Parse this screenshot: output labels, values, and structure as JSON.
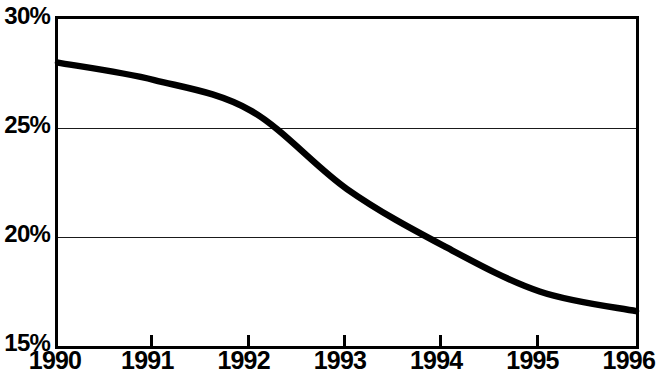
{
  "chart_data": {
    "type": "line",
    "title": "",
    "subtitle": "",
    "xlabel": "",
    "ylabel": "",
    "x": [
      1990,
      1991,
      1992,
      1993,
      1994,
      1995,
      1996
    ],
    "categories": [
      "1990",
      "1991",
      "1992",
      "1993",
      "1994",
      "1995",
      "1996"
    ],
    "values": [
      28.0,
      27.2,
      25.8,
      22.2,
      19.6,
      17.5,
      16.6
    ],
    "series": [
      {
        "name": "",
        "values": [
          28.0,
          27.2,
          25.8,
          22.2,
          19.6,
          17.5,
          16.6
        ]
      }
    ],
    "ylim": [
      15,
      30
    ],
    "xlim": [
      1990,
      1996
    ],
    "y_ticks": [
      15,
      20,
      25,
      30
    ],
    "y_tick_labels": [
      "15%",
      "20%",
      "25%",
      "30%"
    ],
    "x_ticks": [
      1990,
      1991,
      1992,
      1993,
      1994,
      1995,
      1996
    ],
    "x_tick_labels": [
      "1990",
      "1991",
      "1992",
      "1993",
      "1994",
      "1995",
      "1996"
    ],
    "gridlines": {
      "horizontal_at": [
        20,
        25
      ],
      "vertical": false
    },
    "legend": {
      "visible": false,
      "position": "none",
      "entries": []
    },
    "annotations": [],
    "line_color": "#000000",
    "background_color": "#ffffff",
    "axis_color": "#000000"
  }
}
